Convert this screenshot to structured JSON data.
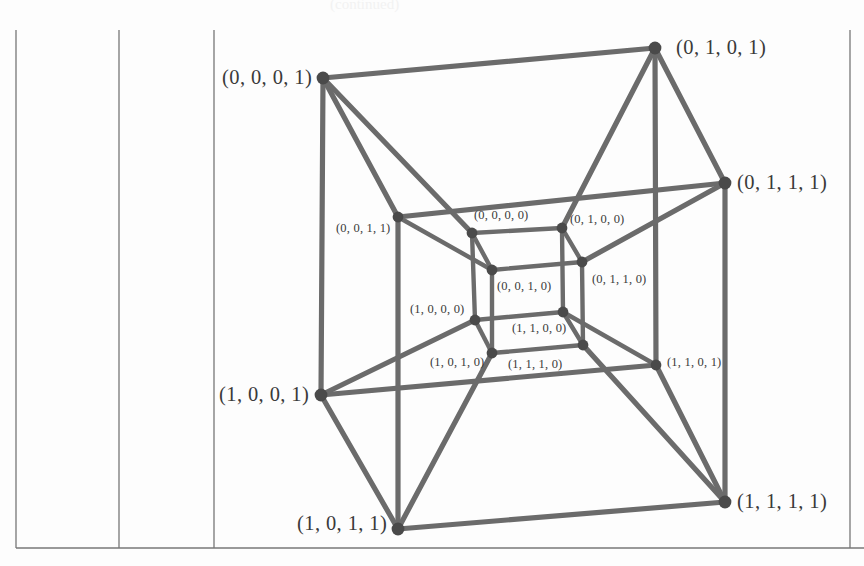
{
  "figure": {
    "kind": "tesseract-graph",
    "caption_fragment_top": "(continued)",
    "edge_color": "#6b6b6b",
    "vertex_color": "#4a4a4a",
    "rule_color": "#777777",
    "background_color": "#fdfdfd"
  },
  "rules": {
    "vertical": [
      {
        "name": "table-rule-left",
        "x": 16,
        "y1": 30,
        "y2": 548
      },
      {
        "name": "table-rule-second",
        "x": 119,
        "y1": 30,
        "y2": 548
      },
      {
        "name": "table-rule-third",
        "x": 214,
        "y1": 30,
        "y2": 548
      },
      {
        "name": "table-rule-right",
        "x": 850,
        "y1": 30,
        "y2": 548
      }
    ],
    "horizontal": [
      {
        "name": "table-rule-bottom",
        "y": 548,
        "x1": 16,
        "x2": 864
      }
    ]
  },
  "chart_data": {
    "type": "graph",
    "title": "",
    "vertex_count": 16,
    "edge_count": 32,
    "vertices": [
      {
        "id": "0001",
        "label": "(0, 0, 0, 1)",
        "x": 323,
        "y": 78,
        "size": "outer",
        "label_x": 222,
        "label_y": 66,
        "label_anchor": "left"
      },
      {
        "id": "0101",
        "label": "(0, 1, 0, 1)",
        "x": 655,
        "y": 48,
        "size": "outer",
        "label_x": 676,
        "label_y": 36,
        "label_anchor": "left"
      },
      {
        "id": "0111",
        "label": "(0, 1, 1, 1)",
        "x": 725,
        "y": 183,
        "size": "outer",
        "label_x": 737,
        "label_y": 171,
        "label_anchor": "left"
      },
      {
        "id": "0011",
        "label": "(0, 0, 1, 1)",
        "x": 398,
        "y": 217,
        "size": "inner",
        "label_x": 336,
        "label_y": 221,
        "label_anchor": "left"
      },
      {
        "id": "1001",
        "label": "(1, 0, 0, 1)",
        "x": 321,
        "y": 395,
        "size": "outer",
        "label_x": 219,
        "label_y": 383,
        "label_anchor": "left"
      },
      {
        "id": "1101",
        "label": "(1, 1, 0, 1)",
        "x": 656,
        "y": 365,
        "size": "inner",
        "label_x": 667,
        "label_y": 355,
        "label_anchor": "left"
      },
      {
        "id": "1011",
        "label": "(1, 0, 1, 1)",
        "x": 398,
        "y": 529,
        "size": "outer",
        "label_x": 297,
        "label_y": 512,
        "label_anchor": "left"
      },
      {
        "id": "1111",
        "label": "(1, 1, 1, 1)",
        "x": 725,
        "y": 502,
        "size": "outer",
        "label_x": 737,
        "label_y": 490,
        "label_anchor": "left"
      },
      {
        "id": "0000",
        "label": "(0, 0, 0, 0)",
        "x": 472,
        "y": 233,
        "size": "inner",
        "label_x": 474,
        "label_y": 208,
        "label_anchor": "left"
      },
      {
        "id": "0100",
        "label": "(0, 1, 0, 0)",
        "x": 562,
        "y": 228,
        "size": "inner",
        "label_x": 570,
        "label_y": 212,
        "label_anchor": "left"
      },
      {
        "id": "0010",
        "label": "(0, 0, 1, 0)",
        "x": 492,
        "y": 270,
        "size": "inner",
        "label_x": 497,
        "label_y": 279,
        "label_anchor": "left"
      },
      {
        "id": "0110",
        "label": "(0, 1, 1, 0)",
        "x": 582,
        "y": 262,
        "size": "inner",
        "label_x": 592,
        "label_y": 272,
        "label_anchor": "left"
      },
      {
        "id": "1000",
        "label": "(1, 0, 0, 0)",
        "x": 475,
        "y": 320,
        "size": "inner",
        "label_x": 410,
        "label_y": 302,
        "label_anchor": "left"
      },
      {
        "id": "1100",
        "label": "(1, 1, 0, 0)",
        "x": 563,
        "y": 312,
        "size": "inner",
        "label_x": 512,
        "label_y": 321,
        "label_anchor": "left"
      },
      {
        "id": "1010",
        "label": "(1, 0, 1, 0)",
        "x": 492,
        "y": 353,
        "size": "inner",
        "label_x": 430,
        "label_y": 355,
        "label_anchor": "left"
      },
      {
        "id": "1110",
        "label": "(1, 1, 1, 0)",
        "x": 583,
        "y": 345,
        "size": "inner",
        "label_x": 508,
        "label_y": 357,
        "label_anchor": "left"
      }
    ],
    "edges": [
      [
        "0001",
        "0101"
      ],
      [
        "0001",
        "0011"
      ],
      [
        "0001",
        "1001"
      ],
      [
        "0001",
        "0000"
      ],
      [
        "0101",
        "0111"
      ],
      [
        "0101",
        "1101"
      ],
      [
        "0101",
        "0100"
      ],
      [
        "0111",
        "0011"
      ],
      [
        "0111",
        "1111"
      ],
      [
        "0111",
        "0110"
      ],
      [
        "0011",
        "1011"
      ],
      [
        "0011",
        "0010"
      ],
      [
        "1001",
        "1101"
      ],
      [
        "1001",
        "1011"
      ],
      [
        "1001",
        "1000"
      ],
      [
        "1101",
        "1111"
      ],
      [
        "1101",
        "1100"
      ],
      [
        "1011",
        "1111"
      ],
      [
        "1011",
        "1010"
      ],
      [
        "1111",
        "1110"
      ],
      [
        "0000",
        "0100"
      ],
      [
        "0000",
        "0010"
      ],
      [
        "0000",
        "1000"
      ],
      [
        "0100",
        "0110"
      ],
      [
        "0100",
        "1100"
      ],
      [
        "0010",
        "0110"
      ],
      [
        "0010",
        "1010"
      ],
      [
        "0110",
        "1110"
      ],
      [
        "1000",
        "1100"
      ],
      [
        "1000",
        "1010"
      ],
      [
        "1100",
        "1110"
      ],
      [
        "1010",
        "1110"
      ]
    ]
  }
}
